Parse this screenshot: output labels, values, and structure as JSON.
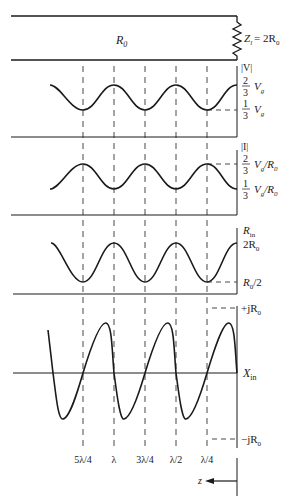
{
  "figure": {
    "line": {
      "label": "R",
      "label_sub": "0",
      "load_label": "Z",
      "load_sub": "l",
      "load_eq": "= 2R",
      "load_eq_sub": "0"
    },
    "panels": [
      {
        "id": "voltage",
        "axis_label": "|V|",
        "max_num": "2",
        "max_den": "3",
        "max_unit": "V",
        "max_unit_sub": "g",
        "min_num": "1",
        "min_den": "3",
        "min_unit": "V",
        "min_unit_sub": "g"
      },
      {
        "id": "current",
        "axis_label": "|I|",
        "max_num": "2",
        "max_den": "3",
        "max_unit": "V",
        "max_unit_sub": "g",
        "max_tail": "/R",
        "max_tail_sub": "0",
        "min_num": "1",
        "min_den": "3",
        "min_unit": "V",
        "min_unit_sub": "g",
        "min_tail": "/R",
        "min_tail_sub": "0"
      },
      {
        "id": "resistance",
        "axis_label": "R",
        "axis_label_sub": "in",
        "max_label": "2R",
        "max_label_sub": "0",
        "min_label": "R",
        "min_label_sub": "0",
        "min_tail": "/2"
      },
      {
        "id": "reactance",
        "axis_label": "X",
        "axis_label_sub": "in",
        "max_label": "+jR",
        "max_label_sub": "0",
        "min_label": "−jR",
        "min_label_sub": "0"
      }
    ],
    "positions": [
      "5λ/4",
      "λ",
      "3λ/4",
      "λ/2",
      "λ/4"
    ],
    "direction_label": "z"
  }
}
